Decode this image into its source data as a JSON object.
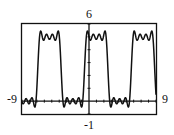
{
  "chart_data": {
    "type": "line",
    "title": "",
    "xlabel": "",
    "ylabel": "",
    "xlim": [
      -9,
      9
    ],
    "ylim": [
      -1,
      6
    ],
    "window_labels": {
      "xmin": "-9",
      "xmax": "9",
      "ymin": "-1",
      "ymax": "6"
    },
    "grid": false,
    "x_tick_step": 1,
    "y_tick_step": 1,
    "series": [
      {
        "name": "f(x)",
        "description": "square-wave-like Fourier partial sum, period ≈ 2π, low ≈ 0, high ≈ 5",
        "offset": 2.5,
        "amplitude": 2.5,
        "phase": 0.6,
        "harmonics": [
          1,
          3,
          5,
          7
        ],
        "samples": 361
      }
    ]
  },
  "colors": {
    "curve": "#111111",
    "frame": "#111111",
    "background": "#ffffff"
  }
}
